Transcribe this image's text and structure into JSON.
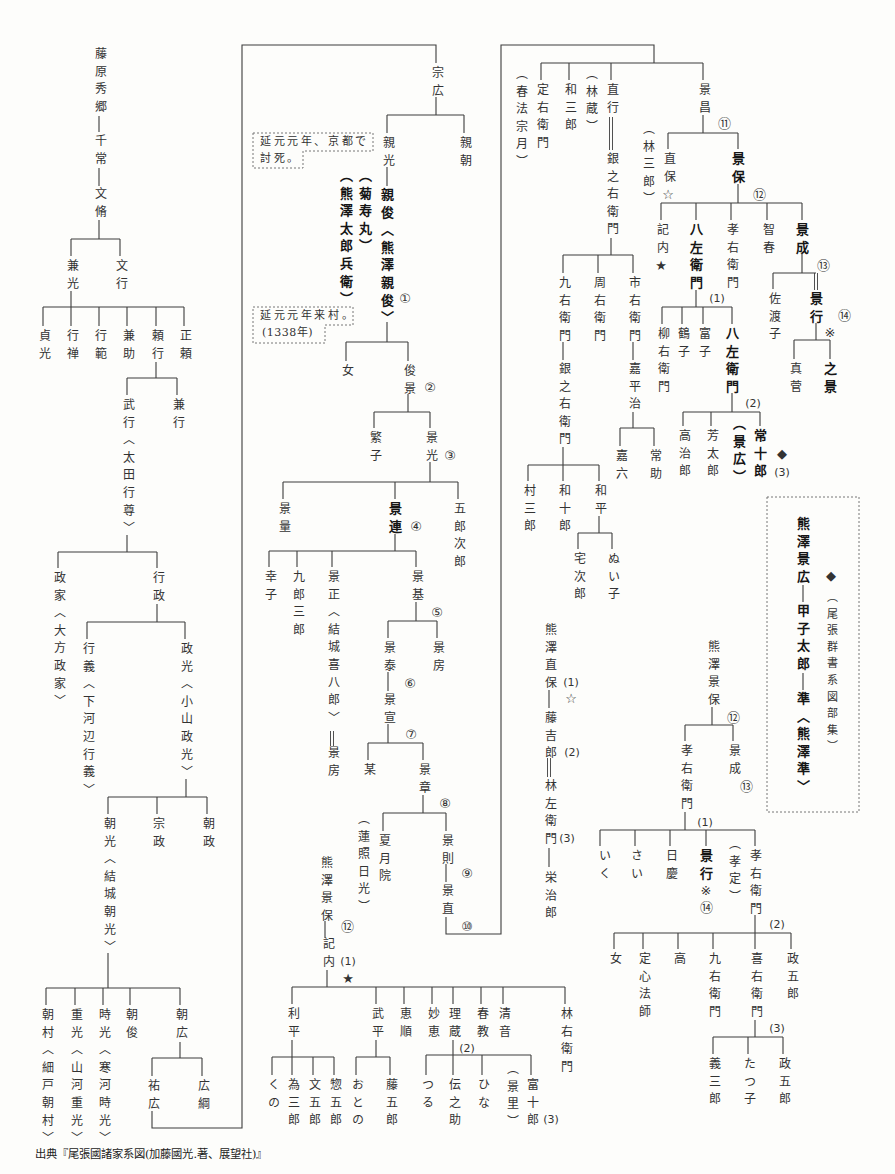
{
  "diagram": {
    "type": "genealogy-tree",
    "nodes": {
      "n1": "藤原秀郷",
      "n2": "千常",
      "n3": "文脩",
      "n4": "兼光",
      "n5": "文行",
      "n6": "貞光",
      "n7": "行禅",
      "n8": "行範",
      "n9": "兼助",
      "n10": "頼行",
      "n11": "正頼",
      "n12": "武行〈太田行尊〉",
      "n13": "兼行",
      "n14": "政家〈大方政家〉",
      "n15": "行政",
      "n16": "行義〈下河辺行義〉",
      "n17": "政光〈小山政光〉",
      "n18": "朝光〈結城朝光〉",
      "n19": "宗政",
      "n20": "朝政",
      "n21": "朝村〈細戸朝村〉",
      "n22": "重光〈山河重光〉",
      "n23": "時光〈寒河時光〉",
      "n24": "朝俊",
      "n25": "朝広",
      "n26": "祐広",
      "n27": "広綱",
      "n28": "宗広",
      "n29": "親光",
      "n30": "親朝",
      "n31": "親俊〈熊澤親俊〉",
      "n32": "（菊寿丸）",
      "n33": "（熊澤太郎兵衛）",
      "n34": "女",
      "n35": "俊景",
      "n36": "繁子",
      "n37": "景光",
      "n38": "景量",
      "n39": "景連",
      "n40": "五郎次郎",
      "n41": "幸子",
      "n42": "九郎三郎",
      "n43": "景正〈結城喜八郎〉",
      "n44": "景房",
      "n45": "景基",
      "n46": "景泰",
      "n47": "景房",
      "n48": "景宣",
      "n49": "某",
      "n50": "景章",
      "n51": "夏月院",
      "n52": "（蓮照日光）",
      "n53": "景則",
      "n54": "景直",
      "n55": "熊澤景保",
      "n56": "記内",
      "n57": "利平",
      "n58": "武平",
      "n59": "恵順",
      "n60": "妙恵",
      "n61": "理蔵",
      "n62": "春教",
      "n63": "清音",
      "n64": "林右衛門",
      "n65": "くの",
      "n66": "為三郎",
      "n67": "文五郎",
      "n68": "惣五郎",
      "n69": "おとの",
      "n70": "藤五郎",
      "n71": "つる",
      "n72": "伝之助",
      "n73": "ひな",
      "n74": "（景里）",
      "n75": "富十郎",
      "n76": "定右衛門",
      "n77": "（春法宗月）",
      "n78": "和三郎",
      "n79": "（林蔵）",
      "n80": "直行",
      "n81": "銀之右衛門",
      "n82": "景昌",
      "n83": "（林三郎）",
      "n84": "直保",
      "n85": "景保",
      "n86": "記内",
      "n87": "八左衛門",
      "n88": "孝右衛門",
      "n89": "智春",
      "n90": "景成",
      "n91": "佐渡子",
      "n92": "景行",
      "n93": "真菅",
      "n94": "之景",
      "n95": "柳右衛門",
      "n96": "鶴子",
      "n97": "富子",
      "n98": "八左衛門",
      "n99": "高治郎",
      "n100": "芳太郎",
      "n101": "（景広）",
      "n102": "常十郎",
      "n103": "九右衛門",
      "n104": "周右衛門",
      "n105": "市右衛門",
      "n106": "銀之右衛門",
      "n107": "嘉平治",
      "n108": "嘉六",
      "n109": "常助",
      "n110": "村三郎",
      "n111": "和十郎",
      "n112": "和平",
      "n113": "宅次郎",
      "n114": "ぬい子",
      "n115": "熊澤直保",
      "n116": "藤吉郎",
      "n117": "林左衛門",
      "n118": "栄治郎",
      "n119": "熊澤景広",
      "n120": "甲子太郎",
      "n121": "準〈熊澤準〉",
      "n122": "（尾張群書系図部集）",
      "n123": "熊澤景保",
      "n124": "孝右衛門",
      "n125": "景成",
      "n126": "いく",
      "n127": "さい",
      "n128": "日慶",
      "n129": "景行",
      "n130": "（孝定）",
      "n131": "孝右衛門",
      "n132": "女",
      "n133": "定心法師",
      "n134": "高",
      "n135": "九右衛門",
      "n136": "喜右衛門",
      "n137": "政五郎",
      "n138": "義三郎",
      "n139": "たつ子",
      "n140": "政五郎"
    },
    "markers": {
      "m1": {
        "text": "①",
        "node": "n31"
      },
      "m2": {
        "text": "②",
        "node": "n35"
      },
      "m3": {
        "text": "③",
        "node": "n37"
      },
      "m4": {
        "text": "④",
        "node": "n39"
      },
      "m5": {
        "text": "⑤",
        "node": "n45"
      },
      "m6": {
        "text": "⑥",
        "node": "n46"
      },
      "m7": {
        "text": "⑦",
        "node": "n48"
      },
      "m8": {
        "text": "⑧",
        "node": "n50"
      },
      "m9": {
        "text": "⑨",
        "node": "n53"
      },
      "m10": {
        "text": "⑩",
        "node": "n54"
      },
      "m11": {
        "text": "⑫",
        "node": "n55"
      },
      "m12": {
        "text": "(1)",
        "node": "n56"
      },
      "m13": {
        "text": "★",
        "node": "n56"
      },
      "m14": {
        "text": "(2)",
        "node": "n61"
      },
      "m15": {
        "text": "(3)",
        "node": "n75"
      },
      "m16": {
        "text": "⑪",
        "node": "n82"
      },
      "m17": {
        "text": "☆",
        "node": "n84"
      },
      "m18": {
        "text": "⑫",
        "node": "n85"
      },
      "m19": {
        "text": "★",
        "node": "n86"
      },
      "m20": {
        "text": "⑬",
        "node": "n90"
      },
      "m21": {
        "text": "⑭",
        "node": "n92"
      },
      "m22": {
        "text": "※",
        "node": "n92"
      },
      "m23": {
        "text": "(1)",
        "node": "n87"
      },
      "m24": {
        "text": "(2)",
        "node": "n98"
      },
      "m25": {
        "text": "◆",
        "node": "n102"
      },
      "m26": {
        "text": "(3)",
        "node": "n102"
      },
      "m27": {
        "text": "◆",
        "node": "n122"
      },
      "m28": {
        "text": "(1)",
        "node": "n115"
      },
      "m29": {
        "text": "☆",
        "node": "n115"
      },
      "m30": {
        "text": "(2)",
        "node": "n116"
      },
      "m31": {
        "text": "(3)",
        "node": "n117"
      },
      "m32": {
        "text": "⑫",
        "node": "n123"
      },
      "m33": {
        "text": "⑬",
        "node": "n125"
      },
      "m34": {
        "text": "(1)",
        "node": "n124"
      },
      "m35": {
        "text": "※",
        "node": "n129"
      },
      "m36": {
        "text": "⑭",
        "node": "n129"
      },
      "m37": {
        "text": "(2)",
        "node": "n131"
      },
      "m38": {
        "text": "(3)",
        "node": "n136"
      }
    },
    "notes": {
      "note1": [
        "延元元年、京都で",
        "討死。"
      ],
      "note2": [
        "延元元年来村。",
        "(1338年)"
      ]
    },
    "relations": [
      {
        "parent": "n1",
        "children": [
          "n2"
        ]
      },
      {
        "parent": "n2",
        "children": [
          "n3"
        ]
      },
      {
        "parent": "n3",
        "children": [
          "n4",
          "n5"
        ]
      },
      {
        "parent": "n4",
        "children": [
          "n6",
          "n7",
          "n8",
          "n9",
          "n10",
          "n11"
        ]
      },
      {
        "parent": "n10",
        "children": [
          "n12",
          "n13"
        ]
      },
      {
        "parent": "n12",
        "children": [
          "n14",
          "n15"
        ]
      },
      {
        "parent": "n15",
        "children": [
          "n16",
          "n17"
        ]
      },
      {
        "parent": "n17",
        "children": [
          "n18",
          "n19",
          "n20"
        ]
      },
      {
        "parent": "n18",
        "children": [
          "n21",
          "n22",
          "n23",
          "n24",
          "n25"
        ]
      },
      {
        "parent": "n25",
        "children": [
          "n26",
          "n27"
        ]
      },
      {
        "parent": "n26",
        "children": [
          "n28"
        ]
      },
      {
        "parent": "n28",
        "children": [
          "n29",
          "n30"
        ]
      },
      {
        "parent": "n29",
        "children": [
          "n31"
        ]
      },
      {
        "parent": "n31",
        "children": [
          "n34",
          "n35"
        ]
      },
      {
        "parent": "n35",
        "children": [
          "n36",
          "n37"
        ]
      },
      {
        "parent": "n37",
        "children": [
          "n38",
          "n39",
          "n40"
        ]
      },
      {
        "parent": "n39",
        "children": [
          "n41",
          "n42",
          "n43",
          "n45"
        ]
      },
      {
        "parent": "n45",
        "children": [
          "n46",
          "n47"
        ]
      },
      {
        "parent": "n46",
        "children": [
          "n48"
        ]
      },
      {
        "parent": "n48",
        "children": [
          "n49",
          "n50"
        ]
      },
      {
        "parent": "n50",
        "children": [
          "n51",
          "n53"
        ]
      },
      {
        "parent": "n53",
        "children": [
          "n54"
        ]
      },
      {
        "parent": "n54",
        "children": [
          "n76",
          "n78",
          "n80",
          "n82"
        ]
      },
      {
        "parent": "n81",
        "children": [
          "n103",
          "n104",
          "n105"
        ]
      },
      {
        "parent": "n103",
        "children": [
          "n106"
        ]
      },
      {
        "parent": "n105",
        "children": [
          "n107"
        ]
      },
      {
        "parent": "n107",
        "children": [
          "n108",
          "n109"
        ]
      },
      {
        "parent": "n106",
        "children": [
          "n110",
          "n111",
          "n112"
        ]
      },
      {
        "parent": "n112",
        "children": [
          "n113",
          "n114"
        ]
      },
      {
        "parent": "n82",
        "children": [
          "n84",
          "n85"
        ]
      },
      {
        "parent": "n85",
        "children": [
          "n86",
          "n87",
          "n88",
          "n89",
          "n90"
        ]
      },
      {
        "parent": "n90",
        "children": [
          "n91",
          "n92"
        ]
      },
      {
        "parent": "n92",
        "children": [
          "n93",
          "n94"
        ]
      },
      {
        "parent": "n87",
        "children": [
          "n95",
          "n96",
          "n97",
          "n98"
        ]
      },
      {
        "parent": "n98",
        "children": [
          "n99",
          "n100",
          "n102"
        ]
      },
      {
        "parent": "n55",
        "children": [
          "n56"
        ]
      },
      {
        "parent": "n56",
        "children": [
          "n57",
          "n58",
          "n59",
          "n60",
          "n61",
          "n62",
          "n63",
          "n64"
        ]
      },
      {
        "parent": "n57",
        "children": [
          "n65",
          "n66",
          "n67",
          "n68"
        ]
      },
      {
        "parent": "n58",
        "children": [
          "n69",
          "n70"
        ]
      },
      {
        "parent": "n61",
        "children": [
          "n71",
          "n72",
          "n73",
          "n75"
        ]
      },
      {
        "parent": "n115",
        "children": [
          "n116"
        ]
      },
      {
        "parent": "n117",
        "children": [
          "n118"
        ]
      },
      {
        "parent": "n119",
        "children": [
          "n120"
        ]
      },
      {
        "parent": "n120",
        "children": [
          "n121"
        ]
      },
      {
        "parent": "n123",
        "children": [
          "n124",
          "n125"
        ]
      },
      {
        "parent": "n124",
        "children": [
          "n126",
          "n127",
          "n128",
          "n129",
          "n131"
        ]
      },
      {
        "parent": "n131",
        "children": [
          "n132",
          "n133",
          "n134",
          "n135",
          "n136",
          "n137"
        ]
      },
      {
        "parent": "n136",
        "children": [
          "n138",
          "n139",
          "n140"
        ]
      }
    ],
    "double_line_links": [
      [
        "n43",
        "n44"
      ],
      [
        "n80",
        "n81"
      ],
      [
        "n90",
        "n92"
      ],
      [
        "n116",
        "n117"
      ]
    ],
    "aliases": {
      "n31": [
        "n32",
        "n33"
      ],
      "n51": [
        "n52"
      ],
      "n75": [
        "n74"
      ],
      "n76": [
        "n77"
      ],
      "n80": [
        "n79"
      ],
      "n84": [
        "n83"
      ],
      "n102": [
        "n101"
      ],
      "n131": [
        "n130"
      ]
    }
  },
  "source": "出典『尾張國諸家系図(加藤國光.著、展望社)』"
}
